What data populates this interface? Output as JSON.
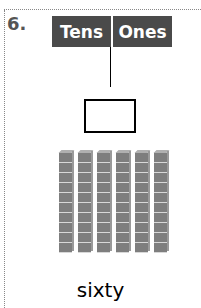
{
  "problem": {
    "number": "6.",
    "place_value_chart": {
      "headers": [
        "Tens",
        "Ones"
      ],
      "answer_box_value": ""
    },
    "blocks": {
      "tens_rods": 6,
      "cubes_per_rod": 10,
      "ones_cubes": 0
    },
    "number_word": "sixty"
  }
}
